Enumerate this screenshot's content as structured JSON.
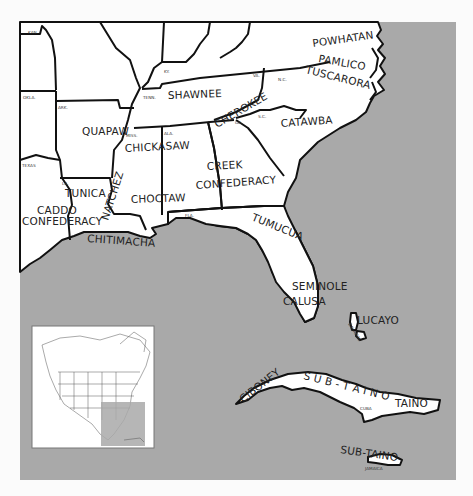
{
  "map": {
    "title": "Southeastern Native American Tribes",
    "colors": {
      "ocean": "#a9a9a9",
      "land": "#ffffff",
      "border": "#111111",
      "page": "#fbfbfb"
    },
    "tribes": [
      {
        "id": "powhatan",
        "label": "POWHATAN"
      },
      {
        "id": "pamlico",
        "label": "PAMLICO"
      },
      {
        "id": "tuscarora",
        "label": "TUSCARORA"
      },
      {
        "id": "shawnee",
        "label": "SHAWNEE"
      },
      {
        "id": "cherokee",
        "label": "CHEROKEE"
      },
      {
        "id": "catawba",
        "label": "CATAWBA"
      },
      {
        "id": "quapaw",
        "label": "QUAPAW"
      },
      {
        "id": "chickasaw",
        "label": "CHICKASAW"
      },
      {
        "id": "creek1",
        "label": "CREEK"
      },
      {
        "id": "creek2",
        "label": "CONFEDERACY"
      },
      {
        "id": "tunica",
        "label": "TUNICA"
      },
      {
        "id": "natchez",
        "label": "NATCHEZ"
      },
      {
        "id": "choctaw",
        "label": "CHOCTAW"
      },
      {
        "id": "caddo1",
        "label": "CADDO"
      },
      {
        "id": "caddo2",
        "label": "CONFEDERACY"
      },
      {
        "id": "chitimacha",
        "label": "CHITIMACHA"
      },
      {
        "id": "tumucua",
        "label": "TUMUCUA"
      },
      {
        "id": "seminole",
        "label": "SEMINOLE"
      },
      {
        "id": "calusa",
        "label": "CALUSA"
      },
      {
        "id": "lucayo",
        "label": "LUCAYO"
      },
      {
        "id": "ciboney",
        "label": "CIBONEY"
      },
      {
        "id": "subtaino_cuba",
        "label": "S U B - T A I N O"
      },
      {
        "id": "taino",
        "label": "TAINO"
      },
      {
        "id": "subtaino_jamaica",
        "label": "SUB-TAINO"
      }
    ],
    "states": [
      {
        "id": "kan",
        "label": "KAN."
      },
      {
        "id": "okla",
        "label": "OKLA."
      },
      {
        "id": "ark",
        "label": "ARK."
      },
      {
        "id": "ky",
        "label": "KY."
      },
      {
        "id": "tenn",
        "label": "TENN."
      },
      {
        "id": "va",
        "label": "VA."
      },
      {
        "id": "nc",
        "label": "N.C."
      },
      {
        "id": "sc",
        "label": "S.C."
      },
      {
        "id": "ga",
        "label": "GA."
      },
      {
        "id": "miss",
        "label": "MISS."
      },
      {
        "id": "ala",
        "label": "ALA."
      },
      {
        "id": "texas",
        "label": "TEXAS"
      },
      {
        "id": "la",
        "label": "LA."
      },
      {
        "id": "fla",
        "label": "FLA."
      },
      {
        "id": "bahamas",
        "label": "BAHAMAS"
      },
      {
        "id": "cuba",
        "label": "CUBA"
      },
      {
        "id": "jamaica",
        "label": "JAMAICA"
      }
    ],
    "inset": {
      "label": "North America locator",
      "highlight_region": "Southeastern United States and Caribbean"
    }
  }
}
